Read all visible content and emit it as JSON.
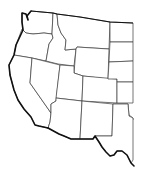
{
  "map": {
    "title": "",
    "type": "blank outline map",
    "region": "Western United States",
    "colors": {
      "fill": "#ffffff",
      "internal_borders": "#3a3a3a",
      "outer_border": "#111111"
    },
    "states": [
      {
        "id": "wa",
        "label": ""
      },
      {
        "id": "or",
        "label": ""
      },
      {
        "id": "ca",
        "label": ""
      },
      {
        "id": "id",
        "label": ""
      },
      {
        "id": "nv",
        "label": ""
      },
      {
        "id": "mt",
        "label": ""
      },
      {
        "id": "wy",
        "label": ""
      },
      {
        "id": "ut",
        "label": ""
      },
      {
        "id": "az",
        "label": ""
      },
      {
        "id": "co",
        "label": ""
      },
      {
        "id": "nm",
        "label": ""
      },
      {
        "id": "nd",
        "label": ""
      },
      {
        "id": "sd",
        "label": ""
      },
      {
        "id": "ne",
        "label": ""
      },
      {
        "id": "ks",
        "label": ""
      },
      {
        "id": "ok",
        "label": ""
      },
      {
        "id": "tx",
        "label": ""
      }
    ]
  }
}
